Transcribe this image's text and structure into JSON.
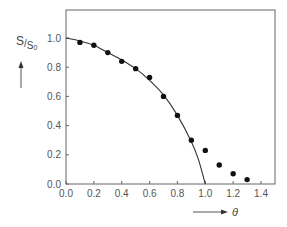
{
  "chart_data": {
    "type": "scatter",
    "title": "",
    "xlabel": "θ",
    "ylabel": "S/S₀",
    "ylabel_main": "S",
    "ylabel_sub": "S",
    "ylabel_sub_index": "0",
    "xlim": [
      0.0,
      1.5
    ],
    "ylim": [
      0.0,
      1.19
    ],
    "x_ticks": [
      "0.0",
      "0.2",
      "0.4",
      "0.6",
      "0.8",
      "1.0",
      "1.2",
      "1.4"
    ],
    "y_ticks": [
      "0.0",
      "0.2",
      "0.4",
      "0.6",
      "0.8",
      "1.0"
    ],
    "grid": false,
    "legend": "none",
    "series": [
      {
        "name": "measured",
        "kind": "points",
        "x": [
          0.1,
          0.2,
          0.3,
          0.4,
          0.5,
          0.6,
          0.7,
          0.8,
          0.9,
          1.0,
          1.1,
          1.2,
          1.3
        ],
        "y": [
          0.97,
          0.95,
          0.9,
          0.84,
          0.79,
          0.73,
          0.6,
          0.47,
          0.3,
          0.23,
          0.13,
          0.07,
          0.03
        ]
      },
      {
        "name": "theory",
        "kind": "line",
        "x": [
          0.0,
          0.1,
          0.2,
          0.3,
          0.4,
          0.5,
          0.6,
          0.7,
          0.8,
          0.9,
          0.95,
          1.0
        ],
        "y": [
          1.0,
          0.98,
          0.95,
          0.9,
          0.85,
          0.79,
          0.71,
          0.61,
          0.47,
          0.29,
          0.17,
          0.0
        ]
      }
    ]
  }
}
